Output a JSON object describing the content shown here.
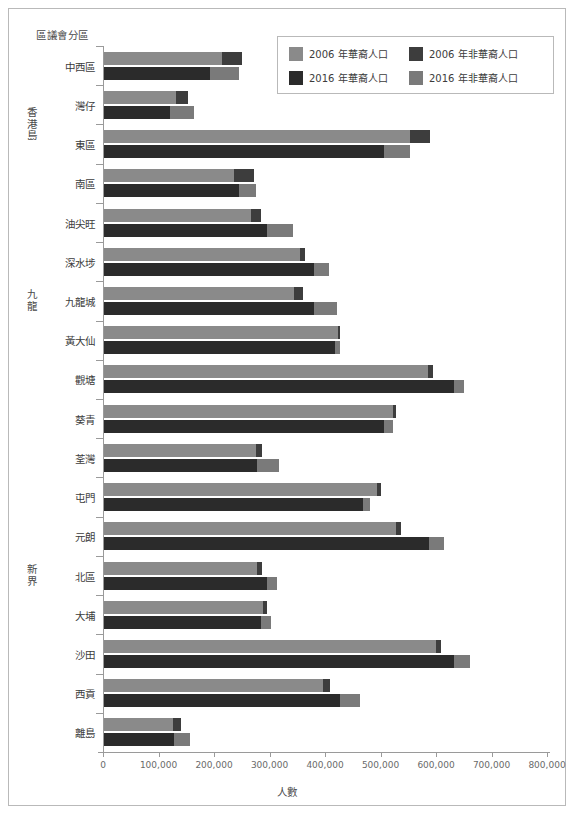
{
  "figure": {
    "y_axis_title": "區議會分區",
    "x_axis_title": "人數"
  },
  "legend": {
    "items": [
      {
        "label": "2006 年華裔人口",
        "color": "#8a8a8a",
        "key": "chinese_2006"
      },
      {
        "label": "2006 年非華裔人口",
        "color": "#3d3d3d",
        "key": "non_chinese_2006"
      },
      {
        "label": "2016 年華裔人口",
        "color": "#2b2b2b",
        "key": "chinese_2016"
      },
      {
        "label": "2016 年非華裔人口",
        "color": "#7a7a7a",
        "key": "non_chinese_2016"
      }
    ]
  },
  "regions": [
    {
      "label": "香港島",
      "count": 4
    },
    {
      "label": "九龍",
      "count": 5
    },
    {
      "label": "新界",
      "count": 9
    }
  ],
  "chart_data": {
    "type": "bar",
    "orientation": "horizontal",
    "grouping": "grouped-stacked",
    "title": "",
    "xlabel": "人數",
    "ylabel": "區議會分區",
    "xlim": [
      0,
      800000
    ],
    "xticks": [
      0,
      100000,
      200000,
      300000,
      400000,
      500000,
      600000,
      700000,
      800000
    ],
    "xtick_labels": [
      "0",
      "100,000",
      "200,000",
      "300,000",
      "400,000",
      "500,000",
      "600,000",
      "700,000",
      "800,000"
    ],
    "grid": false,
    "legend_position": "top-right",
    "categories": [
      "中西區",
      "灣仔",
      "東區",
      "南區",
      "油尖旺",
      "深水埗",
      "九龍城",
      "黃大仙",
      "觀塘",
      "葵青",
      "荃灣",
      "屯門",
      "元朗",
      "北區",
      "大埔",
      "沙田",
      "西貢",
      "離島"
    ],
    "series": [
      {
        "name": "2006 年華裔人口",
        "key": "chinese_2006",
        "color": "#8a8a8a",
        "year": "2006",
        "stack": "2006",
        "values": [
          213000,
          129000,
          551000,
          234000,
          264000,
          354000,
          342000,
          421000,
          583000,
          521000,
          274000,
          491000,
          526000,
          275000,
          286000,
          598000,
          394000,
          124000
        ]
      },
      {
        "name": "2006 年非華裔人口",
        "key": "non_chinese_2006",
        "color": "#3d3d3d",
        "year": "2006",
        "stack": "2006",
        "values": [
          36000,
          23000,
          36000,
          36000,
          18000,
          9000,
          16000,
          5000,
          9000,
          5000,
          11000,
          9000,
          9000,
          9000,
          7000,
          9000,
          14000,
          14000
        ]
      },
      {
        "name": "2016 年華裔人口",
        "key": "chinese_2016",
        "color": "#2b2b2b",
        "year": "2016",
        "stack": "2016",
        "values": [
          191000,
          119000,
          504000,
          243000,
          293000,
          378000,
          378000,
          416000,
          631000,
          505000,
          275000,
          466000,
          585000,
          293000,
          283000,
          630000,
          425000,
          126000
        ]
      },
      {
        "name": "2016 年非華裔人口",
        "key": "non_chinese_2016",
        "color": "#7a7a7a",
        "year": "2016",
        "stack": "2016",
        "values": [
          52000,
          43000,
          47000,
          31000,
          48000,
          27000,
          41000,
          9000,
          18000,
          16000,
          41000,
          14000,
          27000,
          18000,
          18000,
          29000,
          36000,
          29000
        ]
      }
    ]
  }
}
